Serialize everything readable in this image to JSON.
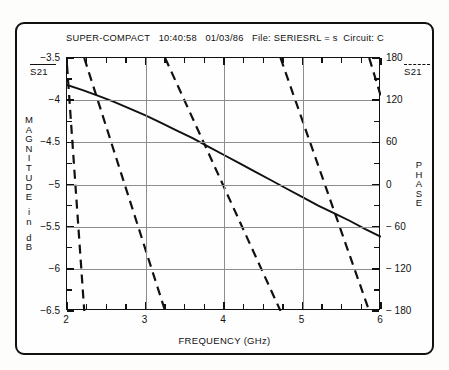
{
  "header": {
    "program": "SUPER-COMPACT",
    "time": "10:40:58",
    "date": "01/03/86",
    "file_label": "File: SERIESRL = s",
    "circuit_label": "Circuit: C"
  },
  "legend": {
    "magnitude_symbol": "S21",
    "phase_symbol": "S21"
  },
  "axes": {
    "left_title_chars": [
      "M",
      "A",
      "G",
      "N",
      "I",
      "T",
      "U",
      "D",
      "E"
    ],
    "left_title_unit_chars": [
      "i",
      "n"
    ],
    "left_title_units_chars": [
      "d",
      "B"
    ],
    "right_title_chars": [
      "P",
      "H",
      "A",
      "S",
      "E"
    ],
    "x_title": "FREQUENCY (GHz)"
  },
  "chart_data": {
    "type": "line",
    "xlabel": "FREQUENCY (GHz)",
    "ylabel": "MAGNITUDE in dB",
    "y2label": "PHASE",
    "xlim": [
      2,
      6
    ],
    "ylim": [
      -6.5,
      -3.5
    ],
    "y2lim": [
      -180,
      180
    ],
    "grid": true,
    "legend_position": "outside-left-and-right",
    "x_ticks": [
      2,
      3,
      4,
      5,
      6
    ],
    "x_tick_labels": [
      "2",
      "3",
      "4",
      "5",
      "6"
    ],
    "x_minor_step": 0.25,
    "y_ticks": [
      -3.5,
      -4,
      -4.5,
      -5,
      -5.5,
      -6,
      -6.5
    ],
    "y_tick_labels": [
      "-3.5",
      "-4",
      "-4.5",
      "-5",
      "-5.5",
      "-6",
      "-6.5"
    ],
    "y_minor_step": 0.25,
    "y2_ticks": [
      180,
      120,
      60,
      0,
      -60,
      -120,
      -180
    ],
    "y2_tick_labels": [
      "180",
      "120",
      "60",
      "0",
      "-60",
      "-120",
      "-180"
    ],
    "y2_minor_step": 30,
    "series": [
      {
        "name": "S21 magnitude",
        "style": "solid",
        "axis": "left",
        "units": "dB",
        "x": [
          2.0,
          2.2,
          2.4,
          2.6,
          2.8,
          3.0,
          3.2,
          3.4,
          3.6,
          3.8,
          4.0,
          4.2,
          4.4,
          4.6,
          4.8,
          5.0,
          5.2,
          5.4,
          5.6,
          5.8,
          6.0
        ],
        "values": [
          -3.82,
          -3.88,
          -3.95,
          -4.02,
          -4.1,
          -4.18,
          -4.27,
          -4.36,
          -4.45,
          -4.55,
          -4.65,
          -4.75,
          -4.85,
          -4.95,
          -5.05,
          -5.15,
          -5.25,
          -5.34,
          -5.43,
          -5.53,
          -5.62
        ]
      },
      {
        "name": "S21 phase",
        "style": "dashed",
        "axis": "right",
        "units": "degrees",
        "wrapped": true,
        "x": [
          2.0,
          2.22,
          2.221,
          3.25,
          3.251,
          4.72,
          4.721,
          5.85,
          5.851,
          6.0
        ],
        "values": [
          170,
          -180,
          180,
          -180,
          180,
          -180,
          180,
          -180,
          180,
          125
        ],
        "segments": [
          {
            "x": [
              2.0,
              2.22
            ],
            "values": [
              170,
              -180
            ]
          },
          {
            "x": [
              2.22,
              3.25
            ],
            "values": [
              180,
              -180
            ]
          },
          {
            "x": [
              3.25,
              4.72
            ],
            "values": [
              180,
              -180
            ]
          },
          {
            "x": [
              4.72,
              5.85
            ],
            "values": [
              180,
              -180
            ]
          },
          {
            "x": [
              5.85,
              6.0
            ],
            "values": [
              180,
              125
            ]
          }
        ]
      }
    ]
  }
}
